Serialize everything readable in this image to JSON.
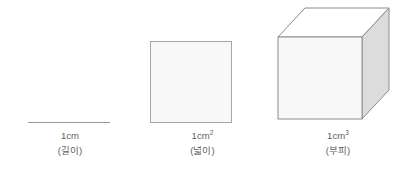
{
  "figure": {
    "background_color": "#ffffff",
    "stroke_color": "#9a9a9a",
    "panels": [
      {
        "id": "length",
        "shape": "line-segment",
        "unit_base": "1cm",
        "unit_exponent": "",
        "meaning": "(길이)",
        "fill_color": "",
        "stroke_color": "#9a9a9a"
      },
      {
        "id": "area",
        "shape": "square",
        "unit_base": "1cm",
        "unit_exponent": "2",
        "meaning": "(넓이)",
        "fill_color": "#f8f8f8",
        "stroke_color": "#a6a6a6"
      },
      {
        "id": "volume",
        "shape": "cube",
        "unit_base": "1cm",
        "unit_exponent": "3",
        "meaning": "(부피)",
        "fill_color": "#f8f8f8",
        "top_face_color": "#ffffff",
        "side_face_color": "#dcdcdc",
        "stroke_color": "#8c8c8c"
      }
    ]
  }
}
